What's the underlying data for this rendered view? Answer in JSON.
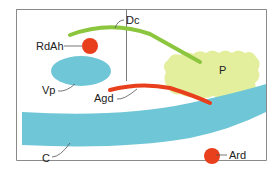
{
  "diagram": {
    "labels": {
      "dc": "Dc",
      "rdah": "RdAh",
      "vp": "Vp",
      "agd": "Agd",
      "p": "P",
      "c": "C",
      "ard": "Ard"
    },
    "colors": {
      "border": "#888888",
      "green": "#8cc63f",
      "red": "#e8401c",
      "blue": "#6fc6d6",
      "yellowgreen": "#e4ef9e",
      "leader": "#555555"
    }
  }
}
